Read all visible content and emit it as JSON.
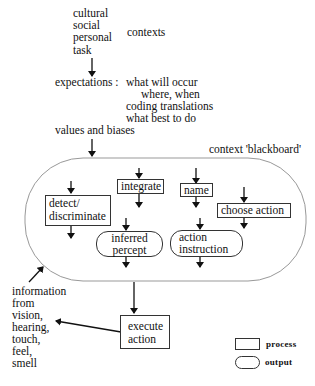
{
  "contexts": {
    "items": [
      "cultural",
      "social",
      "personal",
      "task"
    ],
    "label": "contexts"
  },
  "expectations": {
    "label": "expectations :",
    "lines": [
      "what will occur",
      "where,  when",
      "coding translations",
      "what best to do"
    ]
  },
  "values_biases": "values and biases",
  "blackboard": {
    "label": "context 'blackboard'"
  },
  "processes": {
    "detect": [
      "detect/",
      "discriminate"
    ],
    "integrate": "integrate",
    "name": "name",
    "choose_action": "choose action",
    "execute_action": [
      "execute",
      "action"
    ]
  },
  "outputs": {
    "inferred_percept": [
      "inferred",
      "percept"
    ],
    "action_instruction": [
      "action",
      "instruction"
    ]
  },
  "information": [
    "information",
    "from",
    "vision,",
    "hearing,",
    "touch,",
    "feel,",
    "smell"
  ],
  "legend": {
    "process": "process",
    "output": "output"
  }
}
